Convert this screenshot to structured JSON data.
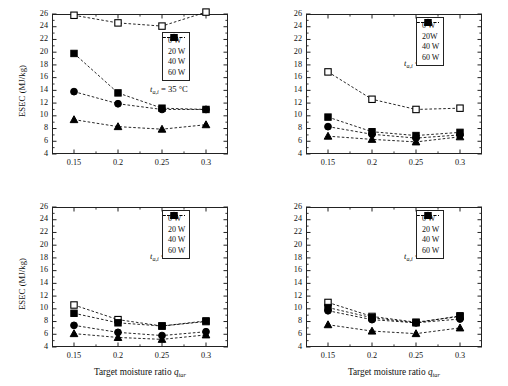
{
  "figure": {
    "panel_count": 4,
    "marker_colors": {
      "fill": "#000000",
      "open_fill": "#ffffff",
      "stroke": "#000000"
    },
    "axis_color": "#222222",
    "line_style": "dashed"
  },
  "axes": {
    "ylabel": "ESEC (MJ/kg)",
    "xlabel_prefix": "Target moisture ratio ",
    "xlabel_var": "q",
    "xlabel_sub": "tar",
    "ylim": [
      4,
      26
    ],
    "yticks": [
      4,
      6,
      8,
      10,
      12,
      14,
      16,
      18,
      20,
      22,
      24,
      26
    ],
    "ytick_labels": [
      "4",
      "6",
      "8",
      "10",
      "12",
      "14",
      "16",
      "18",
      "20",
      "22",
      "24",
      "26"
    ],
    "xlim": [
      0.125,
      0.325
    ],
    "xticks": [
      0.15,
      0.2,
      0.25,
      0.3
    ],
    "xtick_labels": [
      "0.15",
      "0.2",
      "0.25",
      "0.3"
    ],
    "grid": false
  },
  "legend": {
    "position": "upper-right-inside",
    "entries": [
      {
        "label": "0 W",
        "marker": "open-square",
        "power_w": 0
      },
      {
        "label": "20 W",
        "marker": "filled-square",
        "power_w": 20
      },
      {
        "label": "40 W",
        "marker": "filled-circle",
        "power_w": 40
      },
      {
        "label": "60 W",
        "marker": "filled-triangle",
        "power_w": 60
      }
    ],
    "entries_panel_b": [
      {
        "label": "0 W",
        "marker": "open-square",
        "power_w": 0
      },
      {
        "label": "20W",
        "marker": "filled-square",
        "power_w": 20
      },
      {
        "label": "40 W",
        "marker": "filled-circle",
        "power_w": 40
      },
      {
        "label": "60 W",
        "marker": "filled-triangle",
        "power_w": 60
      }
    ]
  },
  "chart_data": [
    {
      "id": "panel-a",
      "type": "line",
      "title": "",
      "annotation_prefix": "t",
      "annotation_sub": "a,i",
      "annotation_suffix": " = 35 °C",
      "xlabel": "Target moisture ratio q_tar",
      "ylabel": "ESEC (MJ/kg)",
      "xlim": [
        0.125,
        0.325
      ],
      "ylim": [
        4,
        26
      ],
      "x": [
        0.15,
        0.2,
        0.25,
        0.3
      ],
      "series": [
        {
          "name": "0 W",
          "marker": "open-square",
          "values": [
            25.8,
            24.6,
            24.1,
            26.3
          ]
        },
        {
          "name": "20 W",
          "marker": "filled-square",
          "values": [
            19.8,
            13.6,
            11.2,
            11.0
          ]
        },
        {
          "name": "40 W",
          "marker": "filled-circle",
          "values": [
            13.8,
            11.9,
            11.0,
            11.0
          ]
        },
        {
          "name": "60 W",
          "marker": "filled-triangle",
          "values": [
            9.4,
            8.3,
            7.9,
            8.6
          ]
        }
      ]
    },
    {
      "id": "panel-b",
      "type": "line",
      "title": "",
      "annotation_prefix": "t",
      "annotation_sub": "a,i",
      "annotation_suffix": " = 45 °C",
      "xlabel": "Target moisture ratio q_tar",
      "ylabel": "ESEC (MJ/kg)",
      "xlim": [
        0.125,
        0.325
      ],
      "ylim": [
        4,
        26
      ],
      "x": [
        0.15,
        0.2,
        0.25,
        0.3
      ],
      "series": [
        {
          "name": "0 W",
          "marker": "open-square",
          "values": [
            16.9,
            12.6,
            11.0,
            11.2
          ]
        },
        {
          "name": "20W",
          "marker": "filled-square",
          "values": [
            9.8,
            7.5,
            6.9,
            7.4
          ]
        },
        {
          "name": "40 W",
          "marker": "filled-circle",
          "values": [
            8.3,
            7.1,
            6.5,
            7.0
          ]
        },
        {
          "name": "60 W",
          "marker": "filled-triangle",
          "values": [
            6.8,
            6.3,
            5.9,
            6.7
          ]
        }
      ]
    },
    {
      "id": "panel-c",
      "type": "line",
      "title": "",
      "annotation_prefix": "t",
      "annotation_sub": "a,i",
      "annotation_suffix": " = 55 °C",
      "xlabel": "Target moisture ratio q_tar",
      "ylabel": "ESEC (MJ/kg)",
      "xlim": [
        0.125,
        0.325
      ],
      "ylim": [
        4,
        26
      ],
      "x": [
        0.15,
        0.2,
        0.25,
        0.3
      ],
      "series": [
        {
          "name": "0 W",
          "marker": "open-square",
          "values": [
            10.6,
            8.3,
            7.3,
            8.0
          ]
        },
        {
          "name": "20 W",
          "marker": "filled-square",
          "values": [
            9.3,
            7.8,
            7.3,
            8.1
          ]
        },
        {
          "name": "40 W",
          "marker": "filled-circle",
          "values": [
            7.4,
            6.3,
            5.8,
            6.4
          ]
        },
        {
          "name": "60 W",
          "marker": "filled-triangle",
          "values": [
            6.1,
            5.5,
            5.2,
            5.9
          ]
        }
      ]
    },
    {
      "id": "panel-d",
      "type": "line",
      "title": "",
      "annotation_prefix": "t",
      "annotation_sub": "a,i",
      "annotation_suffix": " = 65 °C",
      "xlabel": "Target moisture ratio q_tar",
      "ylabel": "ESEC (MJ/kg)",
      "xlim": [
        0.125,
        0.325
      ],
      "ylim": [
        4,
        26
      ],
      "x": [
        0.15,
        0.2,
        0.25,
        0.3
      ],
      "series": [
        {
          "name": "0 W",
          "marker": "open-square",
          "values": [
            11.0,
            8.8,
            7.9,
            8.8
          ]
        },
        {
          "name": "20 W",
          "marker": "filled-square",
          "values": [
            10.2,
            8.6,
            7.8,
            8.9
          ]
        },
        {
          "name": "40 W",
          "marker": "filled-circle",
          "values": [
            9.7,
            8.3,
            7.8,
            8.4
          ]
        },
        {
          "name": "60 W",
          "marker": "filled-triangle",
          "values": [
            7.5,
            6.5,
            6.1,
            7.0
          ]
        }
      ]
    }
  ]
}
